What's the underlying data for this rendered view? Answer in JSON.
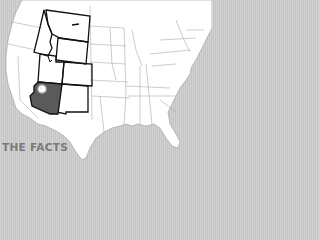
{
  "map": {
    "title": "THE FACTS",
    "region": "Contiguous United States",
    "highlighted_states": [
      "Montana",
      "Idaho",
      "Wyoming",
      "Utah",
      "Colorado",
      "Arizona",
      "New Mexico"
    ],
    "filled_state": "Arizona",
    "marker": {
      "state": "Arizona",
      "icon": "circle-marker-icon"
    },
    "colors": {
      "ocean": "#c9c9c9",
      "land": "#ffffff",
      "state_border": "#8a8a8a",
      "highlight_border": "#111111",
      "filled_state": "#5a5a5a",
      "marker_fill": "#ffffff",
      "label": "#7a7a7a"
    }
  }
}
